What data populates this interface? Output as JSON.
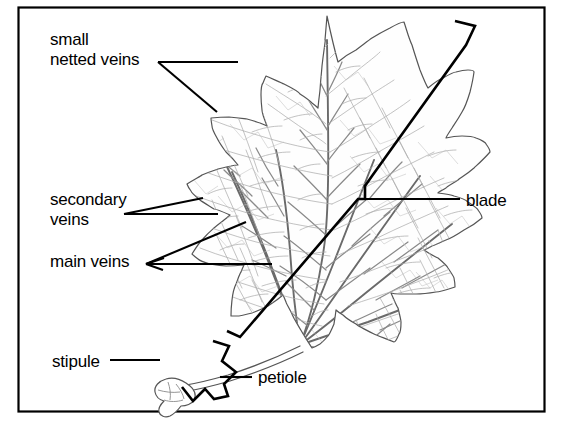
{
  "figure": {
    "frame": {
      "color": "#000000",
      "x": 18,
      "y": 7,
      "width": 527,
      "height": 405
    }
  },
  "colors": {
    "ink": "#000000",
    "vein_major": "#6a6a6a",
    "vein_minor": "#9a9a9a",
    "vein_fine": "#b4b4b4",
    "outline": "#555555",
    "blade_fill": "#fefefe",
    "background": "#ffffff"
  },
  "labels": [
    {
      "id": "small-netted-veins",
      "lines": [
        "small",
        "netted veins"
      ],
      "text": "small netted veins",
      "x": 50,
      "y": 30,
      "leaders": 2
    },
    {
      "id": "secondary-veins",
      "lines": [
        "secondary",
        "veins"
      ],
      "text": "secondary veins",
      "x": 50,
      "y": 190,
      "leaders": 2
    },
    {
      "id": "main-veins",
      "lines": [
        "main veins"
      ],
      "text": "main veins",
      "x": 50,
      "y": 252,
      "leaders": 2
    },
    {
      "id": "blade",
      "lines": [
        "blade"
      ],
      "text": "blade",
      "x": 466,
      "y": 191,
      "leaders": 1
    },
    {
      "id": "stipule",
      "lines": [
        "stipule"
      ],
      "text": "stipule",
      "x": 52,
      "y": 352,
      "leaders": 1
    },
    {
      "id": "petiole",
      "lines": [
        "petiole"
      ],
      "text": "petiole",
      "x": 258,
      "y": 368,
      "leaders": 1
    }
  ],
  "parts": {
    "blade_bracket": "thick line along right side of leaf marking blade extent",
    "petiole_bracket": "chevron bracket below leaf marking petiole extent",
    "stipule_shape": "small irregular blob at base of petiole"
  }
}
